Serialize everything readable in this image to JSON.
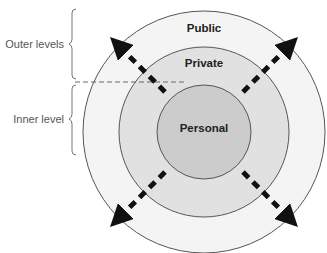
{
  "diagram": {
    "type": "concentric-circles",
    "rings": [
      {
        "name": "public",
        "label": "Public",
        "fill": "#f4f4f4"
      },
      {
        "name": "private",
        "label": "Private",
        "fill": "#e1e1e1"
      },
      {
        "name": "personal",
        "label": "Personal",
        "fill": "#cccccc"
      }
    ],
    "side_labels": {
      "outer": "Outer levels",
      "inner": "Inner level"
    },
    "arrows": [
      "north-west",
      "north-east",
      "south-west",
      "south-east"
    ]
  }
}
